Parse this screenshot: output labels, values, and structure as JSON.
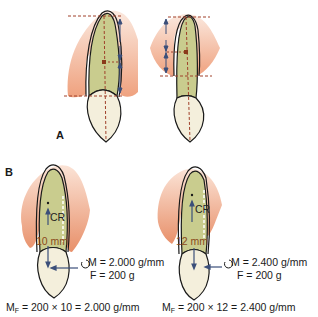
{
  "panels": {
    "a": {
      "label": "A"
    },
    "b": {
      "label": "B"
    }
  },
  "b_left": {
    "center_label": "CR",
    "distance": "10 mm",
    "moment": "M = 2.000 g/mm",
    "force": "F = 200 g",
    "formula_prefix": "M",
    "formula_sub": "F",
    "formula_rest": " = 200 × 10 = 2.000 g/mm"
  },
  "b_right": {
    "center_label": "CR",
    "distance": "12 mm",
    "moment": "M = 2.400 g/mm",
    "force": "F = 200 g",
    "formula_prefix": "M",
    "formula_sub": "F",
    "formula_rest": " = 200 × 12 = 2.400 g/mm"
  },
  "colors": {
    "gum": "#f2b594",
    "root": "#c9cc8e",
    "crown": "#f4efdc",
    "outline": "#1a1a1a",
    "guide": "#a0402a",
    "arrow": "#3b4f7a",
    "mm_text": "#8a4a1a"
  }
}
